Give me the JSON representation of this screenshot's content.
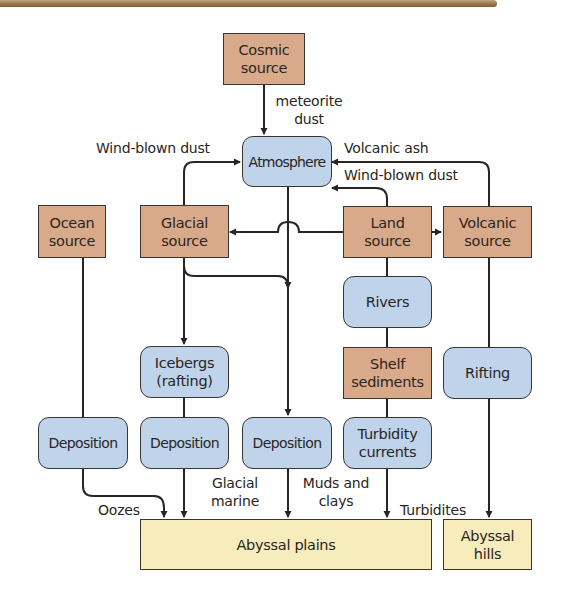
{
  "diagram": {
    "title": "",
    "colors": {
      "source_fill": "#d9aa8a",
      "process_fill": "#bfd3ea",
      "sink_fill": "#f7ecbc",
      "line": "#2a2522",
      "top_rule": "#9c7a4f"
    },
    "nodes": {
      "cosmic": {
        "line1": "Cosmic",
        "line2": "source",
        "type": "source"
      },
      "atmosphere": {
        "label": "Atmosphere",
        "type": "process"
      },
      "ocean": {
        "line1": "Ocean",
        "line2": "source",
        "type": "source"
      },
      "glacial": {
        "line1": "Glacial",
        "line2": "source",
        "type": "source"
      },
      "land": {
        "line1": "Land",
        "line2": "source",
        "type": "source"
      },
      "volcanic": {
        "line1": "Volcanic",
        "line2": "source",
        "type": "source"
      },
      "rivers": {
        "label": "Rivers",
        "type": "process"
      },
      "icebergs": {
        "line1": "Icebergs",
        "line2": "(rafting)",
        "type": "process"
      },
      "shelf": {
        "line1": "Shelf",
        "line2": "sediments",
        "type": "source"
      },
      "rifting": {
        "label": "Rifting",
        "type": "process"
      },
      "deposition_ocean": {
        "label": "Deposition",
        "type": "process"
      },
      "deposition_glacial": {
        "label": "Deposition",
        "type": "process"
      },
      "deposition_atmos": {
        "label": "Deposition",
        "type": "process"
      },
      "turbidity": {
        "line1": "Turbidity",
        "line2": "currents",
        "type": "process"
      },
      "abyssal_plains": {
        "label": "Abyssal plains",
        "type": "sink"
      },
      "abyssal_hills": {
        "line1": "Abyssal",
        "line2": "hills",
        "type": "sink"
      }
    },
    "edge_labels": {
      "meteorite_dust": {
        "line1": "meteorite",
        "line2": "dust"
      },
      "wind_blown_dust_left": "Wind-blown dust",
      "volcanic_ash": "Volcanic ash",
      "wind_blown_dust_right": "Wind-blown dust",
      "oozes": "Oozes",
      "glacial_marine": {
        "line1": "Glacial",
        "line2": "marine"
      },
      "muds_and_clays": {
        "line1": "Muds and",
        "line2": "clays"
      },
      "turbidites": "Turbidites"
    },
    "edges": [
      {
        "from": "cosmic",
        "to": "atmosphere",
        "label": "meteorite dust"
      },
      {
        "from": "glacial",
        "to": "atmosphere",
        "label": "Wind-blown dust"
      },
      {
        "from": "volcanic",
        "to": "atmosphere",
        "label": "Volcanic ash"
      },
      {
        "from": "land",
        "to": "atmosphere",
        "label": "Wind-blown dust"
      },
      {
        "from": "land",
        "to": "glacial"
      },
      {
        "from": "land",
        "to": "volcanic"
      },
      {
        "from": "atmosphere",
        "to": "deposition_atmos"
      },
      {
        "from": "glacial",
        "to": "deposition_atmos"
      },
      {
        "from": "glacial",
        "to": "icebergs"
      },
      {
        "from": "icebergs",
        "to": "deposition_glacial"
      },
      {
        "from": "ocean",
        "to": "deposition_ocean"
      },
      {
        "from": "land",
        "to": "rivers"
      },
      {
        "from": "rivers",
        "to": "shelf"
      },
      {
        "from": "shelf",
        "to": "turbidity"
      },
      {
        "from": "volcanic",
        "to": "rifting"
      },
      {
        "from": "deposition_ocean",
        "to": "abyssal_plains",
        "label": "Oozes"
      },
      {
        "from": "deposition_glacial",
        "to": "abyssal_plains",
        "label": "Glacial marine"
      },
      {
        "from": "deposition_atmos",
        "to": "abyssal_plains",
        "label": "Muds and clays"
      },
      {
        "from": "turbidity",
        "to": "abyssal_plains",
        "label": "Turbidites"
      },
      {
        "from": "rifting",
        "to": "abyssal_hills"
      }
    ]
  }
}
